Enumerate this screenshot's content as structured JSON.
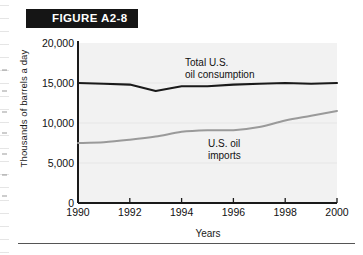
{
  "figure": {
    "banner_label": "FIGURE A2-8"
  },
  "chart_data": {
    "type": "line",
    "title": "FIGURE A2-8",
    "xlabel": "Years",
    "ylabel": "Thousands of barrels a day",
    "xlim": [
      1990,
      2000
    ],
    "ylim": [
      0,
      20000
    ],
    "xticks": [
      "1990",
      "1992",
      "1994",
      "1996",
      "1998",
      "2000"
    ],
    "yticks": [
      "0",
      "5,000",
      "10,000",
      "15,000",
      "20,000"
    ],
    "grid": false,
    "legend": "annotations-inline",
    "x": [
      1990,
      1991,
      1992,
      1993,
      1994,
      1995,
      1996,
      1997,
      1998,
      1999,
      2000
    ],
    "series": [
      {
        "name": "Total U.S. oil consumption",
        "color": "#1a1a1a",
        "values": [
          15000,
          14900,
          14800,
          14000,
          14600,
          14600,
          14800,
          14900,
          15000,
          14900,
          15000
        ],
        "annotation": "Total U.S.\noil consumption"
      },
      {
        "name": "U.S. oil imports",
        "color": "#9a9a9a",
        "values": [
          7500,
          7600,
          7900,
          8300,
          8900,
          9100,
          9100,
          9500,
          10300,
          10900,
          11500
        ],
        "annotation": "U.S. oil\nimports"
      }
    ]
  },
  "colors": {
    "banner_bg": "#151515",
    "banner_text": "#ffffff",
    "plot_bg": "#f2f2f2",
    "axis": "#1a1a1a",
    "consumption_line": "#1a1a1a",
    "imports_line": "#9a9a9a"
  }
}
